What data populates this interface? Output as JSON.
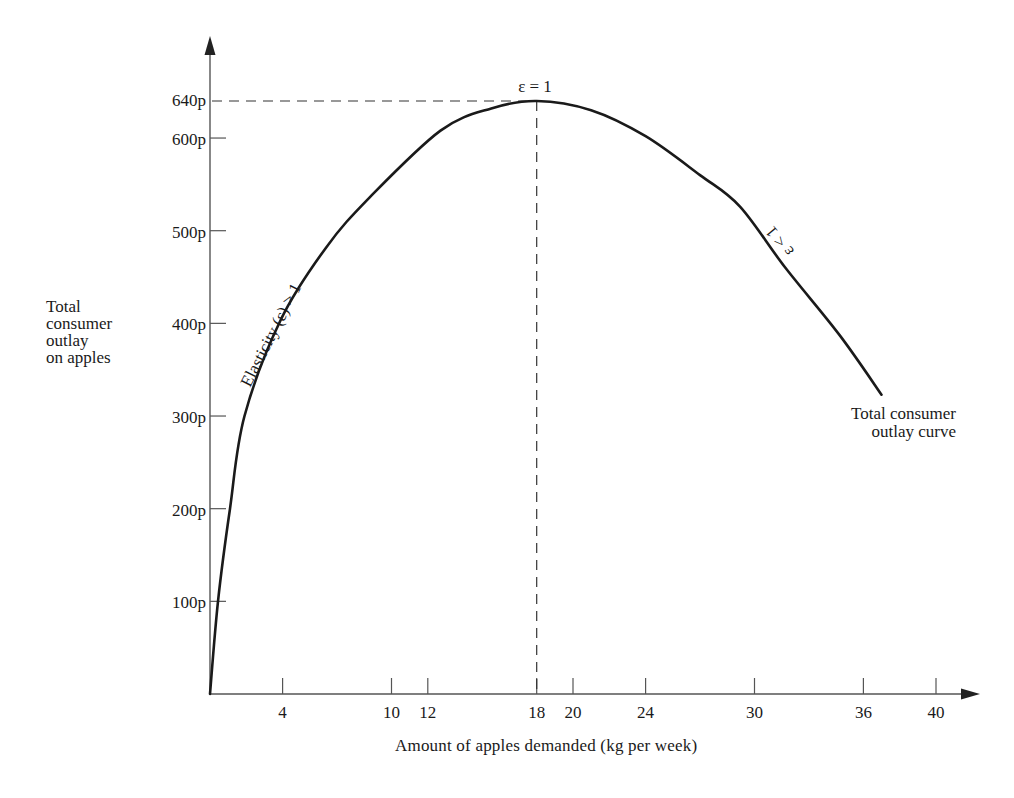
{
  "chart_data": {
    "type": "line",
    "title": "",
    "xlabel": "Amount of apples demanded (kg per week)",
    "ylabel": "Total consumer outlay on apples",
    "xlim": [
      0,
      42
    ],
    "ylim": [
      0,
      700
    ],
    "grid": false,
    "x_ticks": [
      4,
      10,
      12,
      18,
      20,
      24,
      30,
      36,
      40
    ],
    "y_ticks": [
      100,
      200,
      300,
      400,
      500,
      600,
      640
    ],
    "y_tick_labels": [
      "100p",
      "200p",
      "300p",
      "400p",
      "500p",
      "600p",
      "640p"
    ],
    "series": [
      {
        "name": "Total consumer outlay curve",
        "x": [
          0,
          0.44,
          1.1,
          1.9,
          3.9,
          6.4,
          8.8,
          12.7,
          15.5,
          18,
          21,
          24,
          27,
          29.2,
          31.7,
          34.7,
          37
        ],
        "y": [
          0,
          100,
          200,
          300,
          404,
          482,
          536,
          608,
          632,
          640,
          630,
          602,
          560,
          526,
          460,
          387,
          323
        ]
      }
    ],
    "reference_lines": {
      "horizontal": {
        "y": 640,
        "from_x": 0,
        "to_x": 18,
        "style": "dashed"
      },
      "vertical": {
        "x": 18,
        "from_y": 0,
        "to_y": 640,
        "style": "dashed"
      }
    },
    "annotations": [
      {
        "text": "ε = 1",
        "x": 18,
        "y": 640,
        "position": "above"
      },
      {
        "text": "Elasticity (ε) > 1",
        "along": "rising segment",
        "x": 3.5,
        "y": 420
      },
      {
        "text": "ε < 1",
        "along": "falling segment",
        "x": 31,
        "y": 500
      },
      {
        "text": "Total consumer outlay curve",
        "x": 37,
        "y": 300
      }
    ]
  },
  "labels": {
    "y_axis_label": "Total\nconsumer\noutlay\non apples",
    "x_axis_label": "Amount of apples demanded (kg per week)",
    "peak_label": "ε = 1",
    "elastic_label": "Elasticity (ε) > 1",
    "inelastic_label": "ε < 1",
    "curve_label_line1": "Total consumer",
    "curve_label_line2": "outlay curve"
  },
  "colors": {
    "curve": "#1a1a1a",
    "axis": "#555555",
    "background": "#ffffff"
  }
}
